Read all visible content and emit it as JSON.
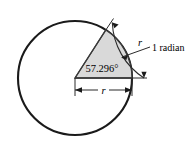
{
  "figure": {
    "colors": {
      "stroke": "#1a1a1a",
      "sector_fill": "#d9d9d9",
      "sector_stroke": "#333333",
      "text": "#000000",
      "background": "#ffffff"
    },
    "circle": {
      "center_x": 75,
      "center_y": 78,
      "radius": 57
    },
    "sector": {
      "angle_degrees": 57.296,
      "angle_radians": 1,
      "start_angle_deg": 0,
      "end_angle_deg": 57.296
    },
    "labels": {
      "angle": "57.296°",
      "arc_length": "r",
      "radius": "r",
      "radian": "1 radian"
    }
  }
}
